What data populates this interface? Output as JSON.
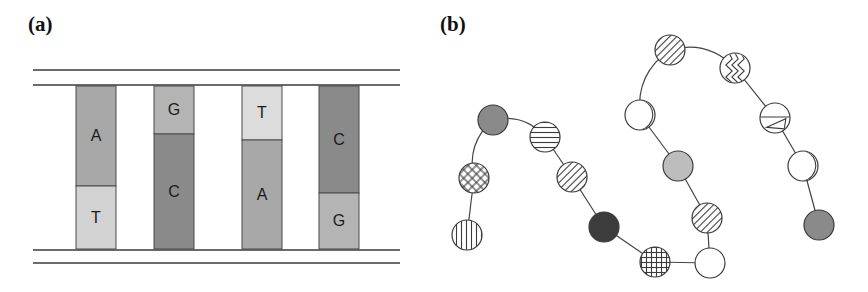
{
  "figure": {
    "width": 868,
    "height": 292,
    "background": "#ffffff"
  },
  "panels": [
    {
      "id": "a",
      "label": "(a)",
      "caption_position": "top-left",
      "description": "DNA double helix schematic: four vertical base-pair rungs between two pairs of horizontal backbone rails",
      "rails": {
        "stroke": "#3a3a3a",
        "x_start": 33,
        "x_end": 400,
        "y_positions": [
          70,
          85,
          250,
          263
        ]
      },
      "rungs": [
        {
          "index": 1,
          "x": 76,
          "width": 40,
          "top": 86,
          "bottom": 249,
          "split_y": 186,
          "upper": {
            "letter": "A",
            "fill": "#a8a8a8"
          },
          "lower": {
            "letter": "T",
            "fill": "#d2d2d2"
          }
        },
        {
          "index": 2,
          "x": 154,
          "width": 40,
          "top": 86,
          "bottom": 249,
          "split_y": 134,
          "upper": {
            "letter": "G",
            "fill": "#b4b4b4"
          },
          "lower": {
            "letter": "C",
            "fill": "#8a8a8a"
          }
        },
        {
          "index": 3,
          "x": 242,
          "width": 40,
          "top": 86,
          "bottom": 249,
          "split_y": 140,
          "upper": {
            "letter": "T",
            "fill": "#dcdcdc"
          },
          "lower": {
            "letter": "A",
            "fill": "#a8a8a8"
          }
        },
        {
          "index": 4,
          "x": 319,
          "width": 40,
          "top": 86,
          "bottom": 249,
          "split_y": 193,
          "upper": {
            "letter": "C",
            "fill": "#8a8a8a"
          },
          "lower": {
            "letter": "G",
            "fill": "#b4b4b4"
          }
        }
      ],
      "sequence_top_strand": [
        "A",
        "G",
        "T",
        "C"
      ],
      "sequence_bottom_strand": [
        "T",
        "C",
        "A",
        "G"
      ]
    },
    {
      "id": "b",
      "label": "(b)",
      "caption_position": "top-left",
      "description": "Protein polypeptide chain schematic: folded chain of amino acid residues drawn as patterned circles joined by bonds",
      "node_radius": 15,
      "bond_stroke": "#444444",
      "nodes": [
        {
          "index": 1,
          "cx": 493,
          "cy": 120,
          "pattern": "solid-gray",
          "fill": "#8a8a8a"
        },
        {
          "index": 2,
          "cx": 474,
          "cy": 178,
          "pattern": "diagonal-crosshatch",
          "fill": "#ffffff"
        },
        {
          "index": 3,
          "cx": 467,
          "cy": 235,
          "pattern": "vertical-stripes",
          "fill": "#ffffff"
        },
        {
          "index": 4,
          "cx": 545,
          "cy": 137,
          "pattern": "horizontal-stripes",
          "fill": "#ffffff"
        },
        {
          "index": 5,
          "cx": 572,
          "cy": 177,
          "pattern": "diagonal-stripes",
          "fill": "#ffffff"
        },
        {
          "index": 6,
          "cx": 604,
          "cy": 227,
          "pattern": "solid-dark",
          "fill": "#3c3c3c"
        },
        {
          "index": 7,
          "cx": 655,
          "cy": 262,
          "pattern": "square-crosshatch",
          "fill": "#ffffff"
        },
        {
          "index": 8,
          "cx": 710,
          "cy": 263,
          "pattern": "empty",
          "fill": "#ffffff"
        },
        {
          "index": 9,
          "cx": 707,
          "cy": 218,
          "pattern": "diagonal-stripes",
          "fill": "#ffffff"
        },
        {
          "index": 10,
          "cx": 678,
          "cy": 166,
          "pattern": "solid-light-gray",
          "fill": "#bdbdbd"
        },
        {
          "index": 11,
          "cx": 640,
          "cy": 115,
          "pattern": "arc-segment",
          "fill": "#ffffff"
        },
        {
          "index": 12,
          "cx": 670,
          "cy": 50,
          "pattern": "diagonal-stripes",
          "fill": "#ffffff"
        },
        {
          "index": 13,
          "cx": 735,
          "cy": 68,
          "pattern": "zigzag",
          "fill": "#ffffff"
        },
        {
          "index": 14,
          "cx": 775,
          "cy": 118,
          "pattern": "line-triangle",
          "fill": "#ffffff"
        },
        {
          "index": 15,
          "cx": 803,
          "cy": 166,
          "pattern": "arc-segment",
          "fill": "#ffffff"
        },
        {
          "index": 16,
          "cx": 819,
          "cy": 225,
          "pattern": "solid-gray",
          "fill": "#8a8a8a"
        }
      ],
      "bonds": [
        {
          "from": 3,
          "to": 2,
          "curved": false
        },
        {
          "from": 2,
          "to": 1,
          "curved": true
        },
        {
          "from": 1,
          "to": 4,
          "curved": true
        },
        {
          "from": 4,
          "to": 5,
          "curved": false
        },
        {
          "from": 5,
          "to": 6,
          "curved": false
        },
        {
          "from": 6,
          "to": 7,
          "curved": false
        },
        {
          "from": 7,
          "to": 8,
          "curved": false
        },
        {
          "from": 8,
          "to": 9,
          "curved": false
        },
        {
          "from": 9,
          "to": 10,
          "curved": false
        },
        {
          "from": 10,
          "to": 11,
          "curved": false
        },
        {
          "from": 11,
          "to": 12,
          "curved": true
        },
        {
          "from": 12,
          "to": 13,
          "curved": true
        },
        {
          "from": 13,
          "to": 14,
          "curved": false
        },
        {
          "from": 14,
          "to": 15,
          "curved": false
        },
        {
          "from": 15,
          "to": 16,
          "curved": false
        }
      ]
    }
  ]
}
